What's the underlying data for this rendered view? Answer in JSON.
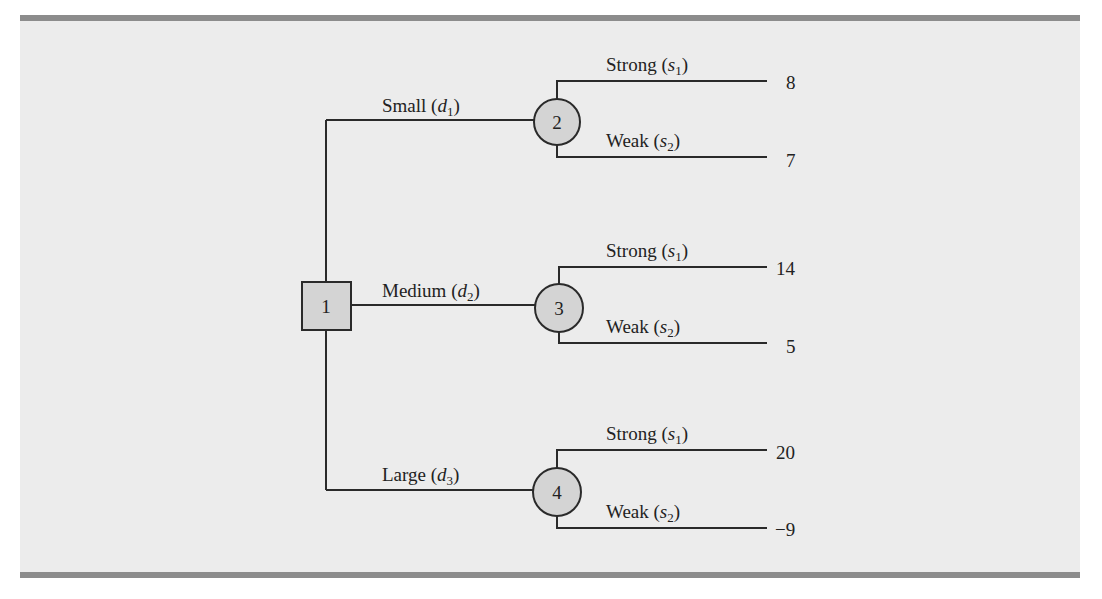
{
  "diagram": {
    "type": "decision-tree",
    "decision_node": {
      "id": "1",
      "shape": "square"
    },
    "decisions": [
      {
        "label": "Small",
        "var": "d",
        "sub": "1",
        "chance_node": "2",
        "outcomes": [
          {
            "label": "Strong",
            "var": "s",
            "sub": "1",
            "payoff": "8"
          },
          {
            "label": "Weak",
            "var": "s",
            "sub": "2",
            "payoff": "7"
          }
        ]
      },
      {
        "label": "Medium",
        "var": "d",
        "sub": "2",
        "chance_node": "3",
        "outcomes": [
          {
            "label": "Strong",
            "var": "s",
            "sub": "1",
            "payoff": "14"
          },
          {
            "label": "Weak",
            "var": "s",
            "sub": "2",
            "payoff": "5"
          }
        ]
      },
      {
        "label": "Large",
        "var": "d",
        "sub": "3",
        "chance_node": "4",
        "outcomes": [
          {
            "label": "Strong",
            "var": "s",
            "sub": "1",
            "payoff": "20"
          },
          {
            "label": "Weak",
            "var": "s",
            "sub": "2",
            "payoff": "−9"
          }
        ]
      }
    ],
    "colors": {
      "panel_bg": "#ececec",
      "rule_bar": "#8c8c8c",
      "node_fill": "#d4d4d4",
      "line": "#2a2a2a"
    }
  }
}
